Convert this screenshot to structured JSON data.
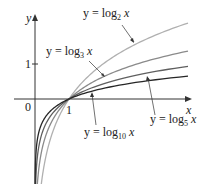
{
  "chart_data": {
    "type": "line",
    "title": "",
    "xlabel": "x",
    "ylabel": "y",
    "x_ticks": [
      {
        "value": 0,
        "label": "0"
      },
      {
        "value": 1,
        "label": "1"
      }
    ],
    "y_ticks": [
      {
        "value": 1,
        "label": "1"
      }
    ],
    "xlim": [
      -0.6,
      4.6
    ],
    "ylim": [
      -2.4,
      2.4
    ],
    "grid": false,
    "legend": "inline annotations",
    "series": [
      {
        "name": "y = log_2 x",
        "base": 2,
        "color": "#b0b0b0",
        "label_main": "y = log",
        "label_sub": "2",
        "label_var": "x"
      },
      {
        "name": "y = log_3 x",
        "base": 3,
        "color": "#8a8a8a",
        "label_main": "y = log",
        "label_sub": "3",
        "label_var": "x"
      },
      {
        "name": "y = log_5 x",
        "base": 5,
        "color": "#5f5f5f",
        "label_main": "y = log",
        "label_sub": "5",
        "label_var": "x"
      },
      {
        "name": "y = log_10 x",
        "base": 10,
        "color": "#262626",
        "label_main": "y = log",
        "label_sub": "10",
        "label_var": "x"
      }
    ],
    "annotations": [
      "All curves pass through the point (1, 0)"
    ]
  },
  "axes": {
    "x_label": "x",
    "y_label": "y",
    "origin_label": "0",
    "x_tick_label": "1",
    "y_tick_label": "1"
  },
  "labels": {
    "log2": {
      "main": "y = log",
      "sub": "2",
      "var": "x"
    },
    "log3": {
      "main": "y = log",
      "sub": "3",
      "var": "x"
    },
    "log5": {
      "main": "y = log",
      "sub": "5",
      "var": "x"
    },
    "log10": {
      "main": "y = log",
      "sub": "10",
      "var": "x"
    }
  }
}
